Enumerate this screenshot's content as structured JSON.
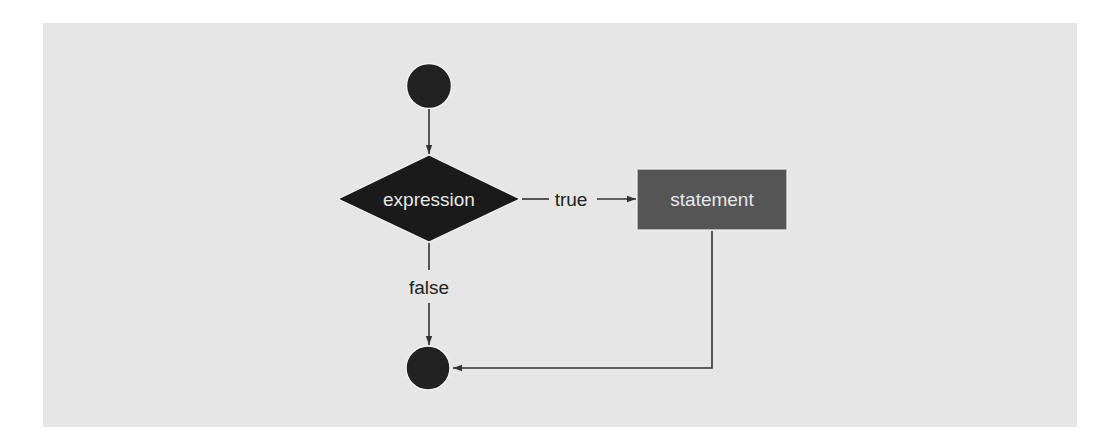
{
  "diagram": {
    "type": "flowchart",
    "colors": {
      "page_background": "#ffffff",
      "panel_background": "#e6e6e6",
      "terminal_fill": "#222222",
      "decision_fill": "#1a1a1a",
      "process_fill": "#555555",
      "node_text": "#e8e8e8",
      "edge_color": "#333333",
      "edge_label_color": "#222222"
    },
    "nodes": {
      "start": {
        "shape": "circle",
        "label": ""
      },
      "decision": {
        "shape": "diamond",
        "label": "expression"
      },
      "process": {
        "shape": "rectangle",
        "label": "statement"
      },
      "end": {
        "shape": "circle",
        "label": ""
      }
    },
    "edges": {
      "start_to_decision": {
        "from": "start",
        "to": "decision",
        "label": ""
      },
      "decision_true": {
        "from": "decision",
        "to": "process",
        "label": "true"
      },
      "decision_false": {
        "from": "decision",
        "to": "end",
        "label": "false"
      },
      "process_to_end": {
        "from": "process",
        "to": "end",
        "label": ""
      }
    }
  }
}
